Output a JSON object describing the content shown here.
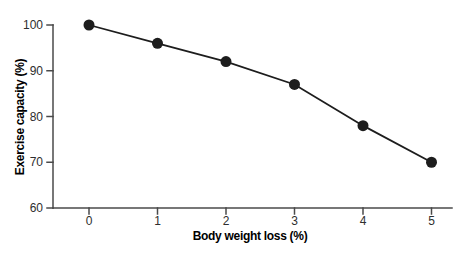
{
  "chart_data": {
    "type": "line",
    "x": [
      0,
      1,
      2,
      3,
      4,
      5
    ],
    "values": [
      100,
      96,
      92,
      87,
      78,
      70
    ],
    "xlabel": "Body weight loss (%)",
    "ylabel": "Exercise capacity (%)",
    "xlim": [
      0,
      5
    ],
    "ylim": [
      60,
      100
    ],
    "x_ticks": [
      0,
      1,
      2,
      3,
      4,
      5
    ],
    "y_ticks": [
      60,
      70,
      80,
      90,
      100
    ],
    "grid": false,
    "legend": "none",
    "marker": "filled-circle",
    "marker_radius": 5.5,
    "line_width": 1.8,
    "colors": {
      "line": "#1d1d1d",
      "marker": "#1d1d1d",
      "axis": "#4a4a4a",
      "text": "#2e2e2e",
      "title_text": "#222222",
      "background": "#ffffff"
    }
  }
}
